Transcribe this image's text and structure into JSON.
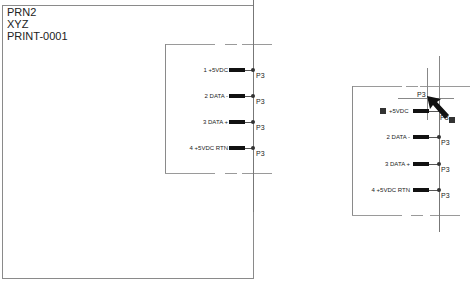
{
  "left_symbol": {
    "title_lines": [
      "PRN2",
      "XYZ",
      "PRINT-0001"
    ],
    "pins": [
      {
        "label": "1  +5VDC",
        "ref": "P3"
      },
      {
        "label": "2 DATA -",
        "ref": "P3"
      },
      {
        "label": "3 DATA +",
        "ref": "P3"
      },
      {
        "label": "4  +5VDC RTN",
        "ref": "P3"
      }
    ]
  },
  "right_symbol": {
    "pins": [
      {
        "label": "+5VDC",
        "ref": "P3"
      },
      {
        "label": "2 DATA -",
        "ref": "P3"
      },
      {
        "label": "3 DATA +",
        "ref": "P3"
      },
      {
        "label": "4  +5VDC RTN",
        "ref": "P3"
      }
    ],
    "dragged_ref": "P3",
    "floating_ref": "P3"
  }
}
